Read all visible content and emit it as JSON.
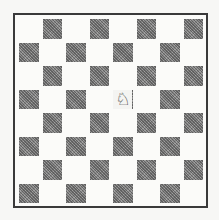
{
  "board": {
    "files": [
      "a",
      "b",
      "c",
      "d",
      "e",
      "f",
      "g",
      "h"
    ],
    "ranks": [
      8,
      7,
      6,
      5,
      4,
      3,
      2,
      1
    ],
    "colors": {
      "light": "#fbfbf9",
      "dark": "#8c8c8c",
      "border": "#3a3a3a"
    },
    "pieces": [
      {
        "square": "e5",
        "type": "knight",
        "color": "white",
        "glyph": "♘"
      }
    ]
  }
}
